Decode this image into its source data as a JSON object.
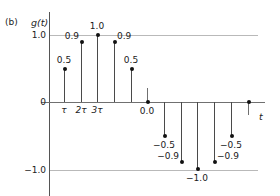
{
  "panel": {
    "label": "(b)"
  },
  "axes": {
    "y_title": "g(t)",
    "x_title": "t",
    "y_ticks": [
      {
        "value": 1.0,
        "label": "1.0"
      },
      {
        "value": 0.0,
        "label": "0"
      },
      {
        "value": -1.0,
        "label": "−1.0"
      }
    ],
    "x_ticks": [
      {
        "label": "τ"
      },
      {
        "label": "2τ"
      },
      {
        "label": "3τ"
      }
    ]
  },
  "chart_data": {
    "type": "stem",
    "title": "",
    "xlabel": "t",
    "ylabel": "g(t)",
    "ylim": [
      -1.0,
      1.0
    ],
    "grid": true,
    "legend": null,
    "x_tick_labels": [
      "τ",
      "2τ",
      "3τ"
    ],
    "x": [
      1,
      2,
      3,
      4,
      5,
      6,
      7,
      8,
      9,
      10,
      11,
      12
    ],
    "values": [
      0.5,
      0.9,
      1.0,
      0.9,
      0.5,
      0.0,
      -0.5,
      -0.9,
      -1.0,
      -0.9,
      -0.5,
      0.0
    ],
    "point_labels": [
      "0.5",
      "0.9",
      "1.0",
      "0.9",
      "0.5",
      "0.0",
      "−0.5",
      "−0.9",
      "−1.0",
      "−0.9",
      "−0.5",
      ""
    ],
    "markers": [
      {
        "x_px": 64,
        "value": 0.5,
        "label": "0.5",
        "label_pos": "above"
      },
      {
        "x_px": 81,
        "value": 0.9,
        "label": "0.9",
        "label_pos": "left"
      },
      {
        "x_px": 97,
        "value": 1.0,
        "label": "1.0",
        "label_pos": "above"
      },
      {
        "x_px": 114,
        "value": 0.9,
        "label": "0.9",
        "label_pos": "right"
      },
      {
        "x_px": 131,
        "value": 0.5,
        "label": "0.5",
        "label_pos": "above"
      },
      {
        "x_px": 147,
        "value": 0.0,
        "label": "0.0",
        "label_pos": "below"
      },
      {
        "x_px": 164,
        "value": -0.5,
        "label": "−0.5",
        "label_pos": "below"
      },
      {
        "x_px": 181,
        "value": -0.9,
        "label": "−0.9",
        "label_pos": "left"
      },
      {
        "x_px": 197,
        "value": -1.0,
        "label": "−1.0",
        "label_pos": "below"
      },
      {
        "x_px": 214,
        "value": -0.9,
        "label": "−0.9",
        "label_pos": "right"
      },
      {
        "x_px": 231,
        "value": -0.5,
        "label": "−0.5",
        "label_pos": "below"
      },
      {
        "x_px": 248,
        "value": 0.0,
        "label": "",
        "label_pos": "none"
      }
    ]
  },
  "colors": {
    "axis": "#707070",
    "gridline": "#b9b9b9",
    "stem": "#4a4a4a",
    "marker": "#111111",
    "text": "#1a1a1a"
  }
}
